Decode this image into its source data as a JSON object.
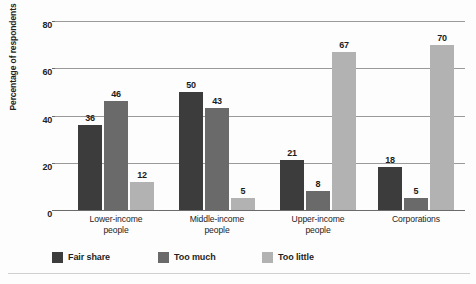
{
  "chart_data": {
    "type": "bar",
    "title": "",
    "subtitle": "",
    "xlabel": "",
    "ylabel": "Percentage of respondents",
    "ylim": [
      0,
      80
    ],
    "yticks": [
      0,
      20,
      40,
      60,
      80
    ],
    "ytick_labels": [
      "0",
      "20",
      "40",
      "60",
      "80"
    ],
    "grid": true,
    "grid_axis": "y",
    "legend_position": "bottom",
    "categories": [
      "Lower-income people",
      "Middle-income people",
      "Upper-income people",
      "Corporations"
    ],
    "category_lines": [
      [
        "Lower-income",
        "people"
      ],
      [
        "Middle-income",
        "people"
      ],
      [
        "Upper-income",
        "people"
      ],
      [
        "Corporations",
        ""
      ]
    ],
    "series": [
      {
        "name": "Fair share",
        "color": "#3c3c3c",
        "values": [
          36,
          50,
          21,
          18
        ]
      },
      {
        "name": "Too much",
        "color": "#6a6a6a",
        "values": [
          46,
          43,
          8,
          5
        ]
      },
      {
        "name": "Too little",
        "color": "#b2b2b2",
        "values": [
          12,
          5,
          67,
          70
        ]
      }
    ],
    "value_labels": [
      [
        36,
        46,
        12
      ],
      [
        50,
        43,
        5
      ],
      [
        21,
        8,
        67
      ],
      [
        18,
        5,
        70
      ]
    ]
  },
  "legend": {
    "items": [
      {
        "label": "Fair share",
        "color": "#3c3c3c"
      },
      {
        "label": "Too much",
        "color": "#6a6a6a"
      },
      {
        "label": "Too little",
        "color": "#b2b2b2"
      }
    ]
  },
  "axis": {
    "y_title": "Percentage of respondents",
    "y_tick_0": "0",
    "y_tick_1": "20",
    "y_tick_2": "40",
    "y_tick_3": "60",
    "y_tick_4": "80"
  },
  "colors": {
    "fair_share": "#3c3c3c",
    "too_much": "#6a6a6a",
    "too_little": "#b2b2b2",
    "gridline": "#9a9a9a",
    "axis": "#6b6b6b",
    "text": "#232323",
    "background": "#fdfdfd"
  }
}
